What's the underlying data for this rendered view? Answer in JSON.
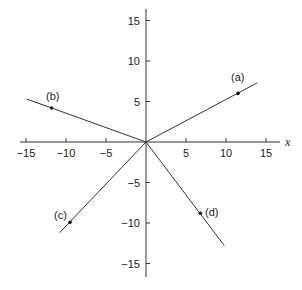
{
  "diagram": {
    "type": "coordinate-plane-lines-through-origin",
    "axes": {
      "x_label": "x",
      "x_ticks": [
        {
          "value": -15,
          "label": "−15"
        },
        {
          "value": -10,
          "label": "−10"
        },
        {
          "value": -5,
          "label": "−5"
        },
        {
          "value": 5,
          "label": "5"
        },
        {
          "value": 10,
          "label": "10"
        },
        {
          "value": 15,
          "label": "15"
        }
      ],
      "y_ticks": [
        {
          "value": 15,
          "label": "15"
        },
        {
          "value": 10,
          "label": "10"
        },
        {
          "value": 5,
          "label": "5"
        },
        {
          "value": -5,
          "label": "−5"
        },
        {
          "value": -10,
          "label": "−10"
        },
        {
          "value": -15,
          "label": "−15"
        }
      ],
      "x_range": [
        -16.5,
        16.5
      ],
      "y_range": [
        -16.5,
        16.5
      ]
    },
    "lines": [
      {
        "id": "a",
        "label": "(a)",
        "point": [
          11.5,
          6
        ],
        "end": [
          13.9,
          7.3
        ]
      },
      {
        "id": "b",
        "label": "(b)",
        "point": [
          -11.8,
          4.2
        ],
        "end": [
          -14.9,
          5.3
        ]
      },
      {
        "id": "c",
        "label": "(c)",
        "point": [
          -9.5,
          -9.9
        ],
        "end": [
          -10.8,
          -11.2
        ]
      },
      {
        "id": "d",
        "label": "(d)",
        "point": [
          6.8,
          -8.8
        ],
        "end": [
          9.8,
          -12.8
        ]
      }
    ]
  }
}
